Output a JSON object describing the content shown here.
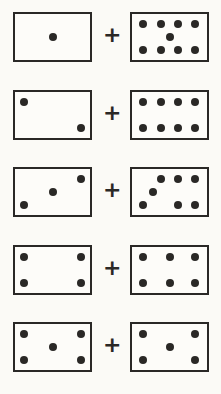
{
  "operator": "+",
  "colors": {
    "ink": "#2a2826",
    "background": "#fbfaf6"
  },
  "rows": [
    {
      "top": 12,
      "left": {
        "count": 1,
        "pips": [
          [
            50,
            50
          ]
        ]
      },
      "right": {
        "count": 9,
        "pips": [
          [
            15,
            22
          ],
          [
            38,
            22
          ],
          [
            61,
            22
          ],
          [
            84,
            22
          ],
          [
            50,
            50
          ],
          [
            15,
            78
          ],
          [
            38,
            78
          ],
          [
            61,
            78
          ],
          [
            84,
            78
          ]
        ]
      }
    },
    {
      "top": 90,
      "left": {
        "count": 2,
        "pips": [
          [
            12,
            22
          ],
          [
            88,
            78
          ]
        ]
      },
      "right": {
        "count": 8,
        "pips": [
          [
            15,
            22
          ],
          [
            38,
            22
          ],
          [
            61,
            22
          ],
          [
            84,
            22
          ],
          [
            15,
            78
          ],
          [
            38,
            78
          ],
          [
            61,
            78
          ],
          [
            84,
            78
          ]
        ]
      }
    },
    {
      "top": 167,
      "left": {
        "count": 3,
        "pips": [
          [
            12,
            78
          ],
          [
            50,
            50
          ],
          [
            88,
            22
          ]
        ]
      },
      "right": {
        "count": 7,
        "pips": [
          [
            15,
            78
          ],
          [
            28,
            50
          ],
          [
            38,
            22
          ],
          [
            61,
            22
          ],
          [
            84,
            22
          ],
          [
            61,
            78
          ],
          [
            84,
            78
          ]
        ]
      }
    },
    {
      "top": 245,
      "left": {
        "count": 4,
        "pips": [
          [
            12,
            22
          ],
          [
            88,
            22
          ],
          [
            12,
            78
          ],
          [
            88,
            78
          ]
        ]
      },
      "right": {
        "count": 6,
        "pips": [
          [
            15,
            22
          ],
          [
            50,
            22
          ],
          [
            84,
            22
          ],
          [
            15,
            78
          ],
          [
            50,
            78
          ],
          [
            84,
            78
          ]
        ]
      }
    },
    {
      "top": 322,
      "left": {
        "count": 5,
        "pips": [
          [
            12,
            22
          ],
          [
            88,
            22
          ],
          [
            50,
            50
          ],
          [
            12,
            78
          ],
          [
            88,
            78
          ]
        ]
      },
      "right": {
        "count": 5,
        "pips": [
          [
            15,
            22
          ],
          [
            84,
            22
          ],
          [
            50,
            50
          ],
          [
            15,
            78
          ],
          [
            84,
            78
          ]
        ]
      }
    }
  ]
}
